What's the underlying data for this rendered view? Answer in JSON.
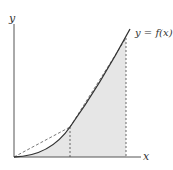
{
  "figure": {
    "y_axis_label": "y",
    "x_axis_label": "x",
    "curve_label": "y = f(x)",
    "colors": {
      "axis": "#555555",
      "curve": "#333333",
      "chord": "#555555",
      "shade": "#e6e6e6",
      "guide": "#444444"
    }
  }
}
